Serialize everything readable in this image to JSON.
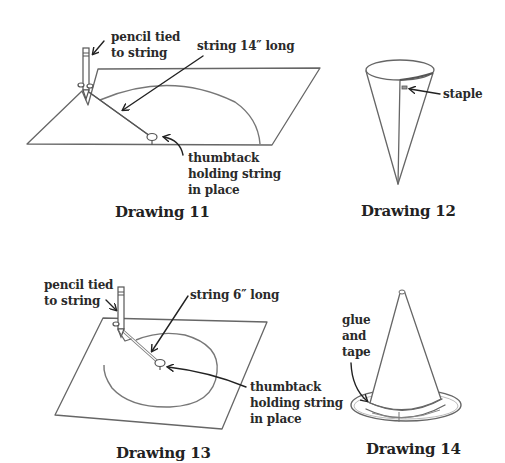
{
  "figure": {
    "drawings": [
      {
        "id": 11,
        "caption": "Drawing 11",
        "labels": {
          "pencil": "pencil tied\nto string",
          "string": "string 14″ long",
          "thumbtack": "thumbtack\nholding string\nin place"
        }
      },
      {
        "id": 12,
        "caption": "Drawing 12",
        "labels": {
          "staple": "staple"
        }
      },
      {
        "id": 13,
        "caption": "Drawing 13",
        "labels": {
          "pencil": "pencil tied\nto string",
          "string": "string 6″ long",
          "thumbtack": "thumbtack\nholding string\nin place"
        }
      },
      {
        "id": 14,
        "caption": "Drawing 14",
        "labels": {
          "glue": "glue\nand\ntape"
        }
      }
    ]
  }
}
